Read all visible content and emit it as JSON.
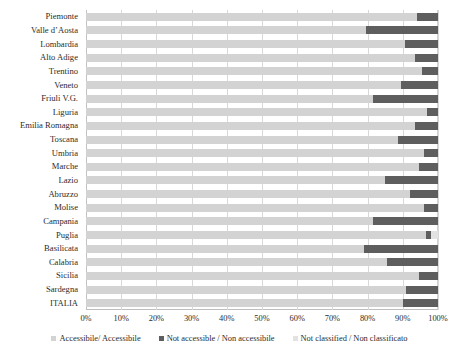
{
  "chart_data": {
    "type": "bar",
    "orientation": "horizontal",
    "stacked": true,
    "stack_mode": "percent",
    "title": "",
    "subtitle": "",
    "xlabel": "",
    "ylabel": "",
    "xlim": [
      0,
      100
    ],
    "grid": true,
    "grid_axis": "x",
    "legend_position": "bottom",
    "xticks": [
      "0%",
      "10%",
      "20%",
      "30%",
      "40%",
      "50%",
      "60%",
      "70%",
      "80%",
      "90%",
      "100%"
    ],
    "xtick_values": [
      0,
      10,
      20,
      30,
      40,
      50,
      60,
      70,
      80,
      90,
      100
    ],
    "categories": [
      "Piemonte",
      "Valle d’Aosta",
      "Lombardia",
      "Alto Adige",
      "Trentino",
      "Veneto",
      "Friuli V.G.",
      "Liguria",
      "Emilia Romagna",
      "Toscana",
      "Umbria",
      "Marche",
      "Lazio",
      "Abruzzo",
      "Molise",
      "Campania",
      "Puglia",
      "Basilicata",
      "Calabria",
      "Sicilia",
      "Sardegna",
      "ITALIA"
    ],
    "series": [
      {
        "name": "Accessibile/ Accessibile",
        "color": "#d3d3d3",
        "values": [
          94.0,
          79.5,
          90.5,
          93.5,
          95.5,
          89.5,
          81.5,
          97.0,
          93.5,
          88.5,
          96.0,
          94.5,
          85.0,
          92.0,
          96.0,
          81.5,
          96.5,
          79.0,
          85.5,
          94.5,
          91.0,
          90.0
        ]
      },
      {
        "name": "Not accessible / Non accessibile",
        "color": "#5e5e5e",
        "values": [
          6.0,
          20.5,
          9.5,
          6.5,
          4.5,
          10.5,
          18.5,
          3.0,
          6.5,
          11.5,
          4.0,
          5.5,
          15.0,
          8.0,
          4.0,
          18.5,
          1.5,
          21.0,
          14.5,
          5.5,
          9.0,
          10.0
        ]
      },
      {
        "name": "Not classified / Non classificato",
        "color": "#e2e2e2",
        "values": [
          0.0,
          0.0,
          0.0,
          0.0,
          0.0,
          0.0,
          0.0,
          0.0,
          0.0,
          0.0,
          0.0,
          0.0,
          0.0,
          0.0,
          0.0,
          0.0,
          2.0,
          0.0,
          0.0,
          0.0,
          0.0,
          0.0
        ]
      }
    ]
  },
  "legend": {
    "items": [
      {
        "label": "Accessibile/ Accessibile",
        "color": "#d3d3d3"
      },
      {
        "label": "Not accessible / Non accessibile",
        "color": "#5e5e5e"
      },
      {
        "label": "Not classified / Non classificato",
        "color": "#e2e2e2"
      }
    ]
  }
}
